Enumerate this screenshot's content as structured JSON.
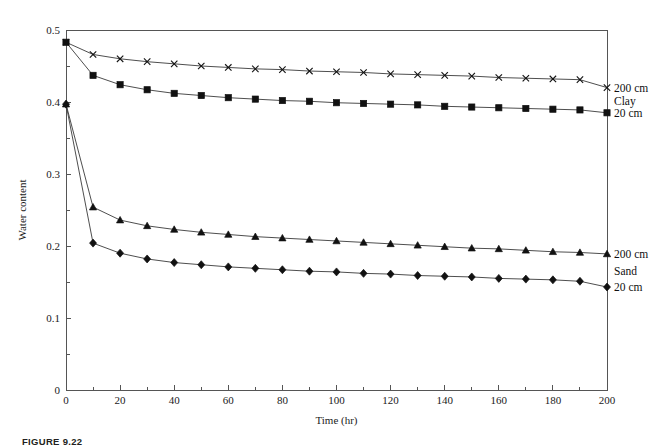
{
  "figure": {
    "caption": "FIGURE 9.22"
  },
  "chart_data": {
    "type": "line",
    "title": "",
    "xlabel": "Time (hr)",
    "ylabel": "Water content",
    "xlim": [
      0,
      200
    ],
    "ylim": [
      0,
      0.5
    ],
    "xticks": [
      0,
      20,
      40,
      60,
      80,
      100,
      120,
      140,
      160,
      180,
      200
    ],
    "xtick_labels": [
      "0",
      "20",
      "40",
      "60",
      "80",
      "100",
      "120",
      "140",
      "160",
      "180",
      "200"
    ],
    "xminor_step": 10,
    "yticks": [
      0,
      0.1,
      0.2,
      0.3,
      0.4,
      0.5
    ],
    "ytick_labels": [
      "0",
      "0.1",
      "0.2",
      "0.3",
      "0.4",
      "0.5"
    ],
    "yminor_step": 0.05,
    "grid": false,
    "legend_position": "right-outside",
    "x": [
      0,
      10,
      20,
      30,
      40,
      50,
      60,
      70,
      80,
      90,
      100,
      110,
      120,
      130,
      140,
      150,
      160,
      170,
      180,
      190,
      200
    ],
    "series": [
      {
        "name": "Clay 200 cm",
        "marker": "cross",
        "legend_label": "200 cm",
        "group": "Clay",
        "values": [
          0.483,
          0.466,
          0.46,
          0.456,
          0.453,
          0.45,
          0.448,
          0.446,
          0.445,
          0.443,
          0.442,
          0.441,
          0.439,
          0.438,
          0.437,
          0.436,
          0.434,
          0.433,
          0.432,
          0.431,
          0.42
        ]
      },
      {
        "name": "Clay 20 cm",
        "marker": "square",
        "legend_label": "20 cm",
        "group": "Clay",
        "values": [
          0.483,
          0.437,
          0.424,
          0.417,
          0.412,
          0.409,
          0.406,
          0.404,
          0.402,
          0.401,
          0.399,
          0.398,
          0.397,
          0.396,
          0.394,
          0.393,
          0.392,
          0.391,
          0.39,
          0.389,
          0.385
        ]
      },
      {
        "name": "Sand 200 cm",
        "marker": "triangle",
        "legend_label": "200 cm",
        "group": "Sand",
        "values": [
          0.397,
          0.254,
          0.236,
          0.228,
          0.223,
          0.219,
          0.216,
          0.213,
          0.211,
          0.209,
          0.207,
          0.205,
          0.203,
          0.201,
          0.199,
          0.197,
          0.196,
          0.194,
          0.192,
          0.191,
          0.189
        ]
      },
      {
        "name": "Sand 20 cm",
        "marker": "diamond",
        "legend_label": "20 cm",
        "group": "Sand",
        "values": [
          0.397,
          0.204,
          0.19,
          0.182,
          0.177,
          0.174,
          0.171,
          0.169,
          0.167,
          0.165,
          0.164,
          0.162,
          0.161,
          0.159,
          0.158,
          0.157,
          0.155,
          0.154,
          0.153,
          0.151,
          0.143
        ]
      }
    ],
    "legend_groups": [
      {
        "top_label": "200 cm",
        "group_label": "Clay",
        "bottom_label": "20 cm"
      },
      {
        "top_label": "200 cm",
        "group_label": "Sand",
        "bottom_label": "20 cm"
      }
    ]
  }
}
